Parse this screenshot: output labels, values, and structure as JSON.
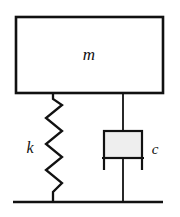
{
  "figure": {
    "kind": "mass-spring-damper-schematic",
    "background_color": "#ffffff",
    "line_color": "#111111",
    "width": 180,
    "height": 217
  },
  "labels": {
    "mass": "m",
    "spring": "k",
    "damper": "c"
  },
  "components": {
    "mass_block": {
      "name": "mass",
      "symbol": "m",
      "fill_color": "#ffffff",
      "stroke_color": "#111111",
      "x": 16,
      "y": 17,
      "width": 147,
      "height": 76
    },
    "spring": {
      "name": "spring",
      "symbol": "k",
      "stroke_color": "#111111",
      "top_x": 53,
      "top_y": 93,
      "bottom_x": 53,
      "bottom_y": 202,
      "amplitude_left_x": 46,
      "amplitude_right_x": 62,
      "coil_count": 7
    },
    "damper": {
      "name": "damper",
      "symbol": "c",
      "fill_color": "#eeeeee",
      "stroke_color": "#111111",
      "rod_x": 123,
      "rod_top_y": 93,
      "rod_bottom_y": 202,
      "cylinder_x": 104,
      "cylinder_y": 131,
      "cylinder_width": 38,
      "cylinder_height": 27,
      "piston_plate_y": 158,
      "piston_plate_left_x": 102,
      "piston_plate_right_x": 144
    },
    "ground": {
      "name": "ground",
      "stroke_color": "#111111",
      "y": 202,
      "left_x": 13,
      "right_x": 163
    }
  },
  "label_positions": {
    "mass": {
      "x": 89,
      "y": 60
    },
    "spring": {
      "x": 30,
      "y": 153
    },
    "damper": {
      "x": 151,
      "y": 154
    }
  }
}
